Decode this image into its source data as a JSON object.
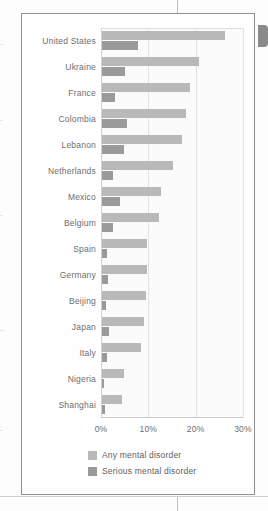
{
  "figure": {
    "legend": [
      {
        "label": "Any mental disorder",
        "color": "#b9b9b9",
        "key": "any"
      },
      {
        "label": "Serious mental disorder",
        "color": "#9a9a9a",
        "key": "serious"
      }
    ]
  },
  "chart_data": {
    "type": "bar",
    "orientation": "horizontal",
    "title": "",
    "xlabel": "",
    "ylabel": "",
    "xlim": [
      0,
      30
    ],
    "xunit": "%",
    "grid": true,
    "legend_position": "bottom",
    "tick_labels": [
      "0%",
      "10%",
      "20%",
      "30%"
    ],
    "tick_values": [
      0,
      10,
      20,
      30
    ],
    "categories": [
      "United States",
      "Ukraine",
      "France",
      "Colombia",
      "Lebanon",
      "Netherlands",
      "Mexico",
      "Belgium",
      "Spain",
      "Germany",
      "Beijing",
      "Japan",
      "Italy",
      "Nigeria",
      "Shanghai"
    ],
    "series": [
      {
        "name": "Any mental disorder",
        "color": "#b9b9b9",
        "values": [
          26.0,
          20.5,
          18.5,
          17.8,
          16.9,
          14.9,
          12.4,
          12.0,
          9.6,
          9.6,
          9.4,
          8.8,
          8.2,
          4.7,
          4.3
        ]
      },
      {
        "name": "Serious mental disorder",
        "color": "#9a9a9a",
        "values": [
          7.7,
          4.8,
          2.7,
          5.2,
          4.6,
          2.3,
          3.7,
          2.4,
          1.0,
          1.2,
          0.9,
          1.5,
          1.0,
          0.4,
          0.6
        ]
      }
    ]
  }
}
